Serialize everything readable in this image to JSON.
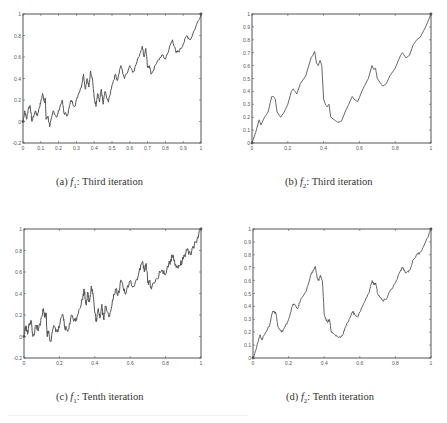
{
  "figure": {
    "panels": [
      {
        "id": "a",
        "caption": {
          "label": "(a)",
          "func": "f",
          "sub": "1",
          "text": ": Third iteration"
        },
        "xlim": [
          0,
          1
        ],
        "ylim": [
          -0.2,
          1
        ],
        "xticks": [
          "0",
          "0.1",
          "0.2",
          "0.3",
          "0.4",
          "0.5",
          "0.6",
          "0.7",
          "0.8",
          "0.9",
          "1"
        ],
        "xtick_values": [
          0,
          0.1,
          0.2,
          0.3,
          0.4,
          0.5,
          0.6,
          0.7,
          0.8,
          0.9,
          1
        ],
        "yticks": [
          "-0.2",
          "0",
          "0.2",
          "0.4",
          "0.6",
          "0.8",
          "1"
        ],
        "ytick_values": [
          -0.2,
          0,
          0.2,
          0.4,
          0.6,
          0.8,
          1
        ]
      },
      {
        "id": "b",
        "caption": {
          "label": "(b)",
          "func": "f",
          "sub": "2",
          "text": ": Third iteration"
        },
        "xlim": [
          0,
          1
        ],
        "ylim": [
          0,
          1
        ],
        "xticks": [
          "0",
          "0.2",
          "0.4",
          "0.6",
          "0.8",
          "1"
        ],
        "xtick_values": [
          0,
          0.2,
          0.4,
          0.6,
          0.8,
          1
        ],
        "yticks": [
          "0",
          "0.1",
          "0.2",
          "0.3",
          "0.4",
          "0.5",
          "0.6",
          "0.7",
          "0.8",
          "0.9",
          "1"
        ],
        "ytick_values": [
          0,
          0.1,
          0.2,
          0.3,
          0.4,
          0.5,
          0.6,
          0.7,
          0.8,
          0.9,
          1
        ]
      },
      {
        "id": "c",
        "caption": {
          "label": "(c)",
          "func": "f",
          "sub": "1",
          "text": ": Tenth iteration"
        },
        "xlim": [
          0,
          1
        ],
        "ylim": [
          -0.2,
          1
        ],
        "xticks": [
          "0",
          "0.2",
          "0.4",
          "0.6",
          "0.8",
          "1"
        ],
        "xtick_values": [
          0,
          0.2,
          0.4,
          0.6,
          0.8,
          1
        ],
        "yticks": [
          "-0.2",
          "0",
          "0.2",
          "0.4",
          "0.6",
          "0.8",
          "1"
        ],
        "ytick_values": [
          -0.2,
          0,
          0.2,
          0.4,
          0.6,
          0.8,
          1
        ]
      },
      {
        "id": "d",
        "caption": {
          "label": "(d)",
          "func": "f",
          "sub": "2",
          "text": ": Tenth iteration"
        },
        "xlim": [
          0,
          1
        ],
        "ylim": [
          0,
          1
        ],
        "xticks": [
          "0",
          "0.2",
          "0.4",
          "0.6",
          "0.8",
          "1"
        ],
        "xtick_values": [
          0,
          0.2,
          0.4,
          0.6,
          0.8,
          1
        ],
        "yticks": [
          "0",
          "0.1",
          "0.2",
          "0.3",
          "0.4",
          "0.5",
          "0.6",
          "0.7",
          "0.8",
          "0.9",
          "1"
        ],
        "ytick_values": [
          0,
          0.1,
          0.2,
          0.3,
          0.4,
          0.5,
          0.6,
          0.7,
          0.8,
          0.9,
          1
        ]
      }
    ],
    "line_color": "#555555",
    "axis_color": "#555555"
  },
  "chart_data": [
    {
      "type": "line",
      "title": "(a) f1: Third iteration",
      "xlabel": "",
      "ylabel": "",
      "xlim": [
        0,
        1
      ],
      "ylim": [
        -0.2,
        1
      ],
      "grid": false,
      "legend": null,
      "x": [
        0,
        0.01,
        0.02,
        0.03,
        0.04,
        0.05,
        0.07,
        0.08,
        0.09,
        0.1,
        0.11,
        0.12,
        0.125,
        0.13,
        0.14,
        0.15,
        0.17,
        0.19,
        0.2,
        0.22,
        0.23,
        0.25,
        0.27,
        0.29,
        0.31,
        0.33,
        0.34,
        0.35,
        0.36,
        0.37,
        0.38,
        0.39,
        0.4,
        0.41,
        0.42,
        0.43,
        0.44,
        0.45,
        0.46,
        0.48,
        0.5,
        0.52,
        0.53,
        0.55,
        0.57,
        0.6,
        0.62,
        0.65,
        0.67,
        0.68,
        0.69,
        0.7,
        0.71,
        0.72,
        0.75,
        0.78,
        0.8,
        0.83,
        0.84,
        0.86,
        0.88,
        0.9,
        0.92,
        0.94,
        0.97,
        1
      ],
      "values": [
        0,
        0.1,
        0.02,
        0.12,
        0.15,
        0.0,
        0.1,
        0.05,
        0.12,
        0.18,
        0.26,
        0.18,
        0.22,
        0.02,
        0.05,
        -0.05,
        0.1,
        0.04,
        0.1,
        0.2,
        0.08,
        0.06,
        0.2,
        0.14,
        0.25,
        0.34,
        0.44,
        0.3,
        0.4,
        0.32,
        0.47,
        0.4,
        0.22,
        0.14,
        0.26,
        0.18,
        0.3,
        0.16,
        0.28,
        0.18,
        0.34,
        0.44,
        0.38,
        0.52,
        0.4,
        0.52,
        0.46,
        0.6,
        0.7,
        0.6,
        0.68,
        0.5,
        0.52,
        0.44,
        0.54,
        0.62,
        0.58,
        0.72,
        0.76,
        0.64,
        0.66,
        0.72,
        0.8,
        0.76,
        0.88,
        1
      ]
    },
    {
      "type": "line",
      "title": "(b) f2: Third iteration",
      "xlabel": "",
      "ylabel": "",
      "xlim": [
        0,
        1
      ],
      "ylim": [
        0,
        1
      ],
      "grid": false,
      "legend": null,
      "x": [
        0,
        0.02,
        0.04,
        0.05,
        0.07,
        0.09,
        0.11,
        0.12,
        0.13,
        0.14,
        0.16,
        0.18,
        0.2,
        0.22,
        0.23,
        0.25,
        0.27,
        0.3,
        0.33,
        0.34,
        0.35,
        0.36,
        0.37,
        0.38,
        0.39,
        0.4,
        0.41,
        0.42,
        0.43,
        0.44,
        0.46,
        0.48,
        0.5,
        0.52,
        0.54,
        0.56,
        0.57,
        0.59,
        0.62,
        0.65,
        0.67,
        0.68,
        0.69,
        0.7,
        0.72,
        0.73,
        0.75,
        0.77,
        0.8,
        0.83,
        0.84,
        0.86,
        0.88,
        0.9,
        0.92,
        0.94,
        0.97,
        1
      ],
      "values": [
        0,
        0.08,
        0.18,
        0.14,
        0.2,
        0.24,
        0.36,
        0.36,
        0.34,
        0.24,
        0.2,
        0.24,
        0.3,
        0.4,
        0.42,
        0.38,
        0.46,
        0.52,
        0.66,
        0.68,
        0.71,
        0.62,
        0.6,
        0.64,
        0.6,
        0.34,
        0.3,
        0.28,
        0.3,
        0.2,
        0.18,
        0.16,
        0.17,
        0.24,
        0.3,
        0.36,
        0.34,
        0.32,
        0.42,
        0.5,
        0.6,
        0.57,
        0.58,
        0.5,
        0.46,
        0.44,
        0.46,
        0.52,
        0.58,
        0.68,
        0.7,
        0.66,
        0.68,
        0.76,
        0.8,
        0.82,
        0.9,
        1
      ]
    },
    {
      "type": "line",
      "title": "(c) f1: Tenth iteration",
      "xlabel": "",
      "ylabel": "",
      "xlim": [
        0,
        1
      ],
      "ylim": [
        -0.2,
        1
      ],
      "grid": false,
      "legend": null,
      "x": [
        0,
        0.01,
        0.02,
        0.03,
        0.04,
        0.05,
        0.07,
        0.08,
        0.09,
        0.1,
        0.11,
        0.12,
        0.125,
        0.13,
        0.14,
        0.15,
        0.17,
        0.19,
        0.2,
        0.22,
        0.23,
        0.25,
        0.27,
        0.29,
        0.31,
        0.33,
        0.34,
        0.35,
        0.36,
        0.37,
        0.38,
        0.39,
        0.4,
        0.41,
        0.42,
        0.43,
        0.44,
        0.45,
        0.46,
        0.48,
        0.5,
        0.52,
        0.53,
        0.55,
        0.57,
        0.6,
        0.62,
        0.65,
        0.67,
        0.68,
        0.69,
        0.7,
        0.71,
        0.72,
        0.75,
        0.78,
        0.8,
        0.83,
        0.84,
        0.86,
        0.88,
        0.9,
        0.92,
        0.94,
        0.97,
        1
      ],
      "values": [
        0,
        0.1,
        0.02,
        0.12,
        0.15,
        0.0,
        0.1,
        0.05,
        0.12,
        0.18,
        0.26,
        0.18,
        0.22,
        0.02,
        0.05,
        -0.05,
        0.1,
        0.04,
        0.1,
        0.2,
        0.08,
        0.06,
        0.2,
        0.14,
        0.25,
        0.34,
        0.44,
        0.3,
        0.4,
        0.32,
        0.47,
        0.4,
        0.22,
        0.14,
        0.26,
        0.18,
        0.3,
        0.16,
        0.28,
        0.18,
        0.34,
        0.44,
        0.38,
        0.52,
        0.4,
        0.52,
        0.46,
        0.6,
        0.7,
        0.6,
        0.68,
        0.5,
        0.52,
        0.44,
        0.54,
        0.62,
        0.58,
        0.72,
        0.76,
        0.64,
        0.66,
        0.72,
        0.8,
        0.76,
        0.88,
        1
      ]
    },
    {
      "type": "line",
      "title": "(d) f2: Tenth iteration",
      "xlabel": "",
      "ylabel": "",
      "xlim": [
        0,
        1
      ],
      "ylim": [
        0,
        1
      ],
      "grid": false,
      "legend": null,
      "x": [
        0,
        0.02,
        0.04,
        0.05,
        0.07,
        0.09,
        0.11,
        0.12,
        0.13,
        0.14,
        0.16,
        0.18,
        0.2,
        0.22,
        0.23,
        0.25,
        0.27,
        0.3,
        0.33,
        0.34,
        0.35,
        0.36,
        0.37,
        0.38,
        0.39,
        0.4,
        0.41,
        0.42,
        0.43,
        0.44,
        0.46,
        0.48,
        0.5,
        0.52,
        0.54,
        0.56,
        0.57,
        0.59,
        0.62,
        0.65,
        0.67,
        0.68,
        0.69,
        0.7,
        0.72,
        0.73,
        0.75,
        0.77,
        0.8,
        0.83,
        0.84,
        0.86,
        0.88,
        0.9,
        0.92,
        0.94,
        0.97,
        1
      ],
      "values": [
        0,
        0.08,
        0.18,
        0.14,
        0.2,
        0.24,
        0.36,
        0.36,
        0.34,
        0.24,
        0.2,
        0.24,
        0.3,
        0.4,
        0.42,
        0.38,
        0.46,
        0.52,
        0.66,
        0.68,
        0.71,
        0.62,
        0.6,
        0.64,
        0.6,
        0.34,
        0.3,
        0.28,
        0.3,
        0.2,
        0.18,
        0.16,
        0.17,
        0.24,
        0.3,
        0.36,
        0.34,
        0.32,
        0.42,
        0.5,
        0.6,
        0.57,
        0.58,
        0.5,
        0.46,
        0.44,
        0.46,
        0.52,
        0.58,
        0.68,
        0.7,
        0.66,
        0.68,
        0.76,
        0.8,
        0.82,
        0.9,
        1
      ]
    }
  ]
}
